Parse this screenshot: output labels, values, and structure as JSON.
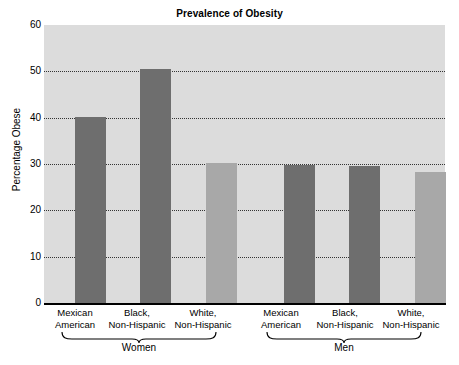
{
  "chart_data": {
    "type": "bar",
    "title": "Prevalence of Obesity",
    "xlabel": "",
    "ylabel": "Percentage Obese",
    "ylim": [
      0,
      60
    ],
    "ytick_values": [
      0,
      10,
      20,
      30,
      40,
      50,
      60
    ],
    "ytick_labels": [
      "0",
      "10",
      "20",
      "30",
      "40",
      "50",
      "60"
    ],
    "grid": true,
    "legend": "none",
    "groups": [
      {
        "name": "Women",
        "categories": [
          "Mexican American",
          "Black, Non-Hispanic",
          "White, Non-Hispanic"
        ],
        "values": [
          40.1,
          50.6,
          30.2
        ]
      },
      {
        "name": "Men",
        "categories": [
          "Mexican American",
          "Black, Non-Hispanic",
          "White, Non-Hispanic"
        ],
        "values": [
          29.7,
          29.5,
          28.3
        ]
      }
    ],
    "categories": [
      "Mexican American",
      "Black, Non-Hispanic",
      "White, Non-Hispanic",
      "Mexican American",
      "Black, Non-Hispanic",
      "White, Non-Hispanic"
    ],
    "values": [
      40.1,
      50.6,
      30.2,
      29.7,
      29.5,
      28.3
    ],
    "colors": {
      "dark_bar": "#6e6e6e",
      "light_bar": "#a8a8a8",
      "plot_background": "#dcdcdc",
      "gridline": "#333333",
      "axis": "#000000",
      "text": "#000000",
      "page_background": "#ffffff"
    },
    "bar_colors": [
      "#6e6e6e",
      "#6e6e6e",
      "#a8a8a8",
      "#6e6e6e",
      "#6e6e6e",
      "#a8a8a8"
    ]
  },
  "axis": {
    "y_label": "Percentage Obese",
    "ticks": [
      {
        "label": "60"
      },
      {
        "label": "50"
      },
      {
        "label": "40"
      },
      {
        "label": "30"
      },
      {
        "label": "20"
      },
      {
        "label": "10"
      },
      {
        "label": "0"
      }
    ]
  },
  "x_labels": [
    {
      "line1": "Mexican",
      "line2": "American"
    },
    {
      "line1": "Black,",
      "line2": "Non-Hispanic"
    },
    {
      "line1": "White,",
      "line2": "Non-Hispanic"
    },
    {
      "line1": "Mexican",
      "line2": "American"
    },
    {
      "line1": "Black,",
      "line2": "Non-Hispanic"
    },
    {
      "line1": "White,",
      "line2": "Non-Hispanic"
    }
  ],
  "groups": [
    {
      "label": "Women"
    },
    {
      "label": "Men"
    }
  ]
}
